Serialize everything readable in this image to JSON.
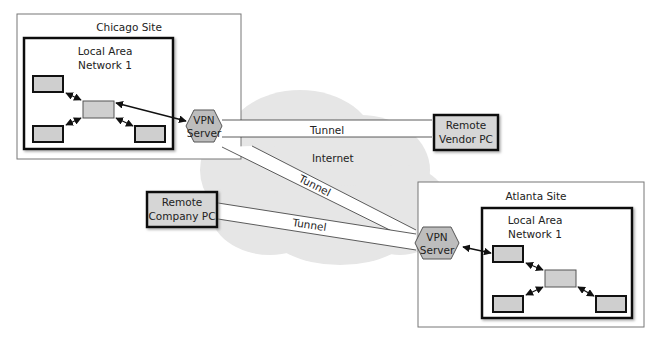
{
  "diagram": {
    "internet_label": "Internet",
    "tunnel_label": "Tunnel",
    "colors": {
      "cloud": "#e6e6e6",
      "node_fill": "#cfcfcf",
      "hexagon_fill": "#bdbdbd",
      "outline": "#111111",
      "site_border": "#777777"
    },
    "chicago": {
      "site_label": "Chicago Site",
      "lan_line1": "Local Area",
      "lan_line2": "Network 1",
      "vpn_line1": "VPN",
      "vpn_line2": "Server"
    },
    "atlanta": {
      "site_label": "Atlanta Site",
      "lan_line1": "Local Area",
      "lan_line2": "Network 1",
      "vpn_line1": "VPN",
      "vpn_line2": "Server"
    },
    "remote_vendor": {
      "line1": "Remote",
      "line2": "Vendor PC"
    },
    "remote_company": {
      "line1": "Remote",
      "line2": "Company PC"
    },
    "tunnels": [
      {
        "from": "Chicago VPN Server",
        "to": "Remote Vendor PC",
        "label": "Tunnel"
      },
      {
        "from": "Chicago VPN Server",
        "to": "Atlanta VPN Server",
        "label": "Tunnel"
      },
      {
        "from": "Remote Company PC",
        "to": "Atlanta VPN Server",
        "label": "Tunnel"
      }
    ]
  }
}
